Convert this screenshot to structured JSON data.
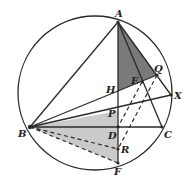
{
  "diagram": {
    "type": "geometry",
    "circle": {
      "cx": 95,
      "cy": 93,
      "r": 77
    },
    "points": {
      "A": {
        "label": "A",
        "x": 118,
        "y": 22
      },
      "B": {
        "label": "B",
        "x": 30,
        "y": 127
      },
      "C": {
        "label": "C",
        "x": 162,
        "y": 127
      },
      "D": {
        "label": "D",
        "x": 118,
        "y": 127
      },
      "E": {
        "label": "E",
        "x": 142,
        "y": 82
      },
      "F": {
        "label": "F",
        "x": 118,
        "y": 163
      },
      "H": {
        "label": "H",
        "x": 118,
        "y": 91
      },
      "P": {
        "label": "P",
        "x": 118,
        "y": 111
      },
      "Q": {
        "label": "Q",
        "x": 157,
        "y": 75
      },
      "R": {
        "label": "R",
        "x": 118,
        "y": 149
      },
      "X": {
        "label": "X",
        "x": 171,
        "y": 95
      }
    },
    "shaded_regions": [
      {
        "name": "triangle-AHQ",
        "vertices": [
          "A",
          "H",
          "Q"
        ],
        "color": "#7a7a7a"
      },
      {
        "name": "quad-BPF",
        "vertices": [
          "B",
          "P",
          "F"
        ],
        "color": "#c8c8c8"
      }
    ],
    "colors": {
      "stroke": "#2a2a2a",
      "dark_shade": "#7a7a7a",
      "light_shade": "#c8c8c8"
    }
  }
}
